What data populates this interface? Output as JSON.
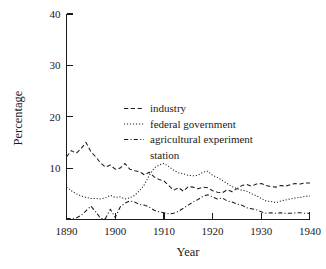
{
  "chart_data": {
    "type": "line",
    "title": "",
    "xlabel": "Year",
    "ylabel": "Percentage",
    "xlim": [
      1890,
      1940
    ],
    "ylim": [
      0,
      40
    ],
    "xticks": [
      1890,
      1900,
      1910,
      1920,
      1930,
      1940
    ],
    "yticks": [
      10,
      20,
      30,
      40
    ],
    "xtick_labels": [
      "1890",
      "1900",
      "1910",
      "1920",
      "1930",
      "1940"
    ],
    "ytick_labels": [
      "10",
      "20",
      "30",
      "40"
    ],
    "grid": false,
    "legend_position": "upper center",
    "x": [
      1890,
      1891,
      1892,
      1893,
      1894,
      1895,
      1896,
      1897,
      1898,
      1899,
      1900,
      1901,
      1902,
      1903,
      1904,
      1905,
      1906,
      1907,
      1908,
      1909,
      1910,
      1911,
      1912,
      1913,
      1914,
      1915,
      1916,
      1917,
      1918,
      1919,
      1920,
      1921,
      1922,
      1923,
      1924,
      1925,
      1926,
      1927,
      1928,
      1929,
      1930,
      1931,
      1932,
      1933,
      1934,
      1935,
      1936,
      1937,
      1938,
      1939,
      1940
    ],
    "series": [
      {
        "name": "industry",
        "linestyle": "dashed",
        "color": "#1a1a1a",
        "values": [
          12.2,
          13.4,
          12.9,
          13.8,
          15.0,
          13.2,
          12.2,
          11.0,
          10.2,
          10.6,
          9.8,
          10.0,
          10.9,
          9.8,
          9.5,
          9.3,
          8.7,
          9.2,
          8.3,
          7.8,
          7.5,
          6.6,
          5.7,
          6.2,
          5.5,
          6.4,
          6.3,
          6.0,
          6.3,
          6.2,
          5.6,
          5.3,
          5.2,
          5.8,
          5.4,
          6.0,
          6.6,
          6.8,
          6.5,
          6.9,
          7.0,
          6.6,
          6.4,
          6.3,
          6.6,
          6.5,
          6.8,
          7.0,
          6.9,
          7.1,
          7.1
        ]
      },
      {
        "name": "federal government",
        "linestyle": "dotted",
        "color": "#1a1a1a",
        "values": [
          6.3,
          5.6,
          5.0,
          4.6,
          4.3,
          4.1,
          4.1,
          4.0,
          4.2,
          4.7,
          4.3,
          4.4,
          4.0,
          4.2,
          4.7,
          5.6,
          6.8,
          8.6,
          10.0,
          10.6,
          10.9,
          10.3,
          9.6,
          9.1,
          8.9,
          8.6,
          8.5,
          8.6,
          9.2,
          9.4,
          8.6,
          8.2,
          7.6,
          7.0,
          6.4,
          6.0,
          5.7,
          5.5,
          5.0,
          4.6,
          4.1,
          3.6,
          3.5,
          3.3,
          3.6,
          3.8,
          4.0,
          4.2,
          4.3,
          4.5,
          4.6
        ]
      },
      {
        "name": "agricultural experiment station",
        "linestyle": "dashdot",
        "color": "#1a1a1a",
        "values": [
          0.2,
          0.2,
          0.3,
          0.8,
          1.7,
          2.6,
          1.5,
          0.2,
          0.2,
          2.0,
          0.4,
          2.4,
          3.2,
          3.6,
          3.4,
          2.9,
          2.8,
          2.4,
          1.8,
          1.5,
          1.3,
          1.1,
          1.2,
          1.6,
          2.2,
          2.8,
          3.4,
          3.9,
          4.5,
          4.8,
          4.4,
          4.0,
          4.2,
          3.6,
          3.4,
          3.0,
          2.8,
          2.3,
          2.1,
          1.9,
          1.5,
          1.2,
          1.3,
          1.2,
          1.3,
          1.2,
          1.2,
          1.3,
          1.3,
          1.2,
          1.2
        ]
      }
    ],
    "legend": [
      {
        "label": "industry",
        "linestyle": "dashed"
      },
      {
        "label": "federal government",
        "linestyle": "dotted"
      },
      {
        "label": "agricultural experiment",
        "linestyle": "dashdot"
      },
      {
        "label": "station",
        "linestyle": "none"
      }
    ]
  }
}
